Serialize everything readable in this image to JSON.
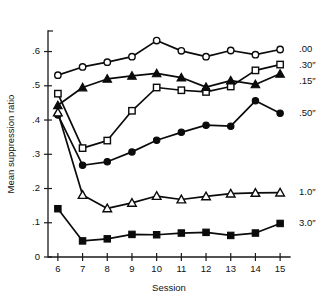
{
  "chart_data": {
    "type": "line",
    "title": "",
    "xlabel": "Session",
    "ylabel": "Mean suppression ratio",
    "x": [
      6,
      7,
      8,
      9,
      10,
      11,
      12,
      13,
      14,
      15
    ],
    "xtick_labels": [
      "6",
      "7",
      "8",
      "9",
      "10",
      "11",
      "12",
      "13",
      "14",
      "15"
    ],
    "ytick_labels": [
      "0",
      ".1",
      ".2",
      ".3",
      ".4",
      ".5",
      ".6"
    ],
    "ytick_values": [
      0,
      0.1,
      0.2,
      0.3,
      0.4,
      0.5,
      0.6
    ],
    "xlim": [
      5.6,
      15.4
    ],
    "ylim": [
      0,
      0.66
    ],
    "grid": false,
    "legend_position": "right-inline",
    "series": [
      {
        "name": ".00",
        "label": ".00",
        "marker": "open-circle",
        "values": [
          0.531,
          0.555,
          0.569,
          0.585,
          0.632,
          0.602,
          0.585,
          0.603,
          0.591,
          0.606
        ],
        "label_y": 0.605
      },
      {
        "name": ".30″",
        "label": ".30″",
        "marker": "open-square",
        "values": [
          0.477,
          0.318,
          0.34,
          0.427,
          0.495,
          0.487,
          0.482,
          0.498,
          0.545,
          0.562
        ],
        "label_y": 0.558
      },
      {
        "name": ".15″",
        "label": ".15″",
        "marker": "filled-triangle",
        "values": [
          0.443,
          0.495,
          0.52,
          0.529,
          0.536,
          0.524,
          0.496,
          0.515,
          0.504,
          0.535
        ],
        "label_y": 0.512
      },
      {
        "name": ".50″",
        "label": ".50″",
        "marker": "filled-circle",
        "values": [
          0.415,
          0.268,
          0.278,
          0.307,
          0.341,
          0.364,
          0.385,
          0.382,
          0.456,
          0.42
        ],
        "label_y": 0.418
      },
      {
        "name": "1.0″",
        "label": "1.0″",
        "marker": "open-triangle",
        "values": [
          0.422,
          0.181,
          0.142,
          0.158,
          0.178,
          0.168,
          0.177,
          0.185,
          0.187,
          0.188
        ],
        "label_y": 0.188
      },
      {
        "name": "3.0″",
        "label": "3.0″",
        "marker": "filled-square",
        "values": [
          0.141,
          0.047,
          0.053,
          0.066,
          0.065,
          0.07,
          0.072,
          0.063,
          0.07,
          0.098
        ],
        "label_y": 0.098
      }
    ]
  }
}
